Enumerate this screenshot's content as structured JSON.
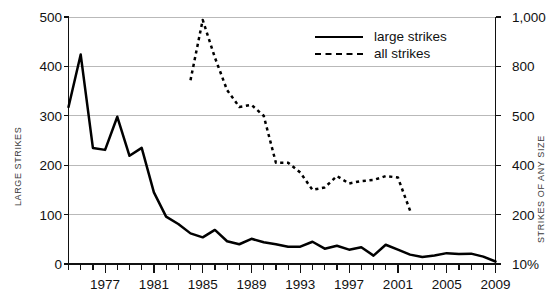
{
  "chart_data": {
    "type": "line",
    "title": "",
    "xlabel": "",
    "ylabel": "LARGE STRIKES",
    "ylabel_right": "STRIKES OF ANY SIZE",
    "grid": true,
    "legend_position": "top-center-right",
    "xlim": [
      1974,
      2009
    ],
    "ylim": [
      0,
      500
    ],
    "xticks_labeled": [
      "1977",
      "1981",
      "1985",
      "1989",
      "1993",
      "1997",
      "2001",
      "2005",
      "2009"
    ],
    "xtick_values": [
      1977,
      1981,
      1985,
      1989,
      1993,
      1997,
      2001,
      2005,
      2009
    ],
    "yticks_left": [
      "0",
      "100",
      "200",
      "300",
      "400",
      "500"
    ],
    "ytick_values_left": [
      0,
      100,
      200,
      300,
      400,
      500
    ],
    "yticks_right": [
      "10%",
      "200",
      "400",
      "500",
      "800",
      "1,000"
    ],
    "ytick_values_right": [
      0,
      100,
      200,
      300,
      400,
      500
    ],
    "series": [
      {
        "name": "large strikes",
        "style": "solid",
        "axis": "left",
        "x": [
          1974,
          1975,
          1976,
          1977,
          1978,
          1979,
          1980,
          1981,
          1982,
          1983,
          1984,
          1985,
          1986,
          1987,
          1988,
          1989,
          1990,
          1991,
          1992,
          1993,
          1994,
          1995,
          1996,
          1997,
          1998,
          1999,
          2000,
          2001,
          2002,
          2003,
          2004,
          2005,
          2006,
          2007,
          2008,
          2009
        ],
        "values": [
          318,
          424,
          235,
          231,
          298,
          219,
          235,
          145,
          96,
          81,
          62,
          54,
          69,
          46,
          40,
          51,
          44,
          40,
          35,
          35,
          45,
          31,
          37,
          29,
          34,
          17,
          39,
          29,
          19,
          14,
          17,
          22,
          20,
          21,
          15,
          5
        ]
      },
      {
        "name": "all strikes",
        "style": "dashed",
        "axis": "right",
        "x": [
          1984,
          1985,
          1986,
          1987,
          1988,
          1989,
          1990,
          1991,
          1992,
          1993,
          1994,
          1995,
          1996,
          1997,
          1998,
          1999,
          2000,
          2001,
          2002
        ],
        "values_left_scale": [
          372,
          494,
          418,
          352,
          318,
          322,
          300,
          205,
          205,
          185,
          150,
          155,
          178,
          163,
          168,
          170,
          178,
          175,
          108
        ],
        "values_right_axis": [
          700,
          1000,
          860,
          680,
          560,
          570,
          520,
          400,
          400,
          370,
          305,
          312,
          356,
          328,
          338,
          342,
          356,
          350,
          210
        ]
      }
    ]
  },
  "legend": {
    "items": [
      {
        "label": "large strikes",
        "style": "solid"
      },
      {
        "label": "all strikes",
        "style": "dashed"
      }
    ]
  }
}
